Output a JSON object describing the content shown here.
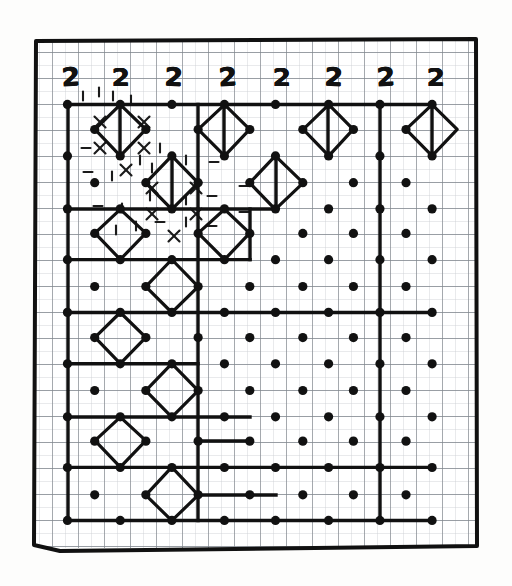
{
  "page": {
    "background_color": "#ffffff",
    "ink_color": "#111111",
    "graph_paper_color": "#8a8f96",
    "graph_paper_minor_color": "#c2c6cb"
  },
  "frame": {
    "border_color": "#111111",
    "border_width_px": 4,
    "x": 33,
    "y": 38,
    "width": 444,
    "height": 512
  },
  "clues": {
    "label": "top clue row",
    "values": [
      "2",
      "2",
      "2",
      "2",
      "2",
      "2",
      "2",
      "2"
    ],
    "positions_x": [
      70,
      120,
      173,
      227,
      281,
      333,
      385,
      435
    ],
    "position_y": 77
  },
  "grid": {
    "origin_x": 68,
    "origin_y": 104,
    "cell": 26,
    "minor_cell": 13,
    "cols": 15,
    "rows": 16,
    "dot_radius": 4.6,
    "lattice_note": "bold dots on alternating (checkerboard) lattice sites, spacing 52px diagonal"
  },
  "dots": [
    [
      68,
      104
    ],
    [
      120,
      104
    ],
    [
      172,
      104
    ],
    [
      224,
      104
    ],
    [
      276,
      104
    ],
    [
      328,
      104
    ],
    [
      380,
      104
    ],
    [
      432,
      104
    ],
    [
      94,
      130
    ],
    [
      146,
      130
    ],
    [
      198,
      130
    ],
    [
      250,
      130
    ],
    [
      302,
      130
    ],
    [
      354,
      130
    ],
    [
      406,
      130
    ],
    [
      68,
      156
    ],
    [
      120,
      156
    ],
    [
      172,
      156
    ],
    [
      224,
      156
    ],
    [
      276,
      156
    ],
    [
      328,
      156
    ],
    [
      380,
      156
    ],
    [
      432,
      156
    ],
    [
      94,
      182
    ],
    [
      146,
      182
    ],
    [
      198,
      182
    ],
    [
      250,
      182
    ],
    [
      302,
      182
    ],
    [
      354,
      182
    ],
    [
      406,
      182
    ],
    [
      68,
      208
    ],
    [
      120,
      208
    ],
    [
      172,
      208
    ],
    [
      224,
      208
    ],
    [
      276,
      208
    ],
    [
      328,
      208
    ],
    [
      380,
      208
    ],
    [
      432,
      208
    ],
    [
      94,
      234
    ],
    [
      146,
      234
    ],
    [
      198,
      234
    ],
    [
      250,
      234
    ],
    [
      302,
      234
    ],
    [
      354,
      234
    ],
    [
      406,
      234
    ],
    [
      68,
      260
    ],
    [
      120,
      260
    ],
    [
      172,
      260
    ],
    [
      224,
      260
    ],
    [
      276,
      260
    ],
    [
      328,
      260
    ],
    [
      380,
      260
    ],
    [
      432,
      260
    ],
    [
      94,
      286
    ],
    [
      146,
      286
    ],
    [
      198,
      286
    ],
    [
      250,
      286
    ],
    [
      302,
      286
    ],
    [
      354,
      286
    ],
    [
      406,
      286
    ],
    [
      68,
      312
    ],
    [
      120,
      312
    ],
    [
      172,
      312
    ],
    [
      224,
      312
    ],
    [
      276,
      312
    ],
    [
      328,
      312
    ],
    [
      380,
      312
    ],
    [
      432,
      312
    ],
    [
      94,
      338
    ],
    [
      146,
      338
    ],
    [
      198,
      338
    ],
    [
      250,
      338
    ],
    [
      302,
      338
    ],
    [
      354,
      338
    ],
    [
      406,
      338
    ],
    [
      68,
      364
    ],
    [
      120,
      364
    ],
    [
      172,
      364
    ],
    [
      224,
      364
    ],
    [
      276,
      364
    ],
    [
      328,
      364
    ],
    [
      380,
      364
    ],
    [
      432,
      364
    ],
    [
      94,
      390
    ],
    [
      146,
      390
    ],
    [
      198,
      390
    ],
    [
      250,
      390
    ],
    [
      302,
      390
    ],
    [
      354,
      390
    ],
    [
      406,
      390
    ],
    [
      68,
      416
    ],
    [
      120,
      416
    ],
    [
      172,
      416
    ],
    [
      224,
      416
    ],
    [
      276,
      416
    ],
    [
      328,
      416
    ],
    [
      380,
      416
    ],
    [
      432,
      416
    ],
    [
      94,
      442
    ],
    [
      146,
      442
    ],
    [
      198,
      442
    ],
    [
      250,
      442
    ],
    [
      302,
      442
    ],
    [
      354,
      442
    ],
    [
      406,
      442
    ],
    [
      68,
      468
    ],
    [
      120,
      468
    ],
    [
      172,
      468
    ],
    [
      224,
      468
    ],
    [
      276,
      468
    ],
    [
      328,
      468
    ],
    [
      380,
      468
    ],
    [
      432,
      468
    ],
    [
      94,
      494
    ],
    [
      146,
      494
    ],
    [
      198,
      494
    ],
    [
      250,
      494
    ],
    [
      302,
      494
    ],
    [
      354,
      494
    ],
    [
      406,
      494
    ],
    [
      68,
      520
    ],
    [
      120,
      520
    ],
    [
      172,
      520
    ],
    [
      224,
      520
    ],
    [
      276,
      520
    ],
    [
      328,
      520
    ],
    [
      380,
      520
    ],
    [
      432,
      520
    ]
  ],
  "diamonds": [
    {
      "cx": 120,
      "cy": 130,
      "r": 26,
      "name": "diamond-r1c1"
    },
    {
      "cx": 172,
      "cy": 182,
      "r": 26,
      "name": "diamond-r2c2"
    },
    {
      "cx": 224,
      "cy": 130,
      "r": 26,
      "name": "diamond-r1c3"
    },
    {
      "cx": 276,
      "cy": 182,
      "r": 26,
      "name": "diamond-r2c4"
    },
    {
      "cx": 328,
      "cy": 130,
      "r": 26,
      "name": "diamond-r1c5"
    },
    {
      "cx": 432,
      "cy": 130,
      "r": 26,
      "name": "diamond-r1c7"
    },
    {
      "cx": 120,
      "cy": 234,
      "r": 26,
      "name": "diamond-r3c1"
    },
    {
      "cx": 224,
      "cy": 234,
      "r": 26,
      "name": "diamond-r3c3"
    },
    {
      "cx": 172,
      "cy": 286,
      "r": 26,
      "name": "diamond-r4c2"
    },
    {
      "cx": 120,
      "cy": 338,
      "r": 26,
      "name": "diamond-r5c1"
    },
    {
      "cx": 172,
      "cy": 390,
      "r": 26,
      "name": "diamond-r6c2"
    },
    {
      "cx": 120,
      "cy": 442,
      "r": 26,
      "name": "diamond-r7c1"
    },
    {
      "cx": 172,
      "cy": 494,
      "r": 26,
      "name": "diamond-r8c2"
    }
  ],
  "bold_segments": [
    {
      "x1": 68,
      "y1": 104,
      "x2": 432,
      "y2": 104,
      "name": "top-bold-rail"
    },
    {
      "x1": 68,
      "y1": 104,
      "x2": 68,
      "y2": 520,
      "name": "left-bold-rail"
    },
    {
      "x1": 198,
      "y1": 104,
      "x2": 198,
      "y2": 520,
      "name": "mid-vertical-rail"
    },
    {
      "x1": 380,
      "y1": 104,
      "x2": 380,
      "y2": 520,
      "name": "right-vertical-rail"
    },
    {
      "x1": 68,
      "y1": 208,
      "x2": 198,
      "y2": 208,
      "name": "hrail-row3-left"
    },
    {
      "x1": 198,
      "y1": 208,
      "x2": 276,
      "y2": 208,
      "name": "hrail-row3-mid"
    },
    {
      "x1": 68,
      "y1": 260,
      "x2": 250,
      "y2": 260,
      "name": "hrail-row4"
    },
    {
      "x1": 250,
      "y1": 260,
      "x2": 250,
      "y2": 208,
      "name": "vstub-row4"
    },
    {
      "x1": 68,
      "y1": 312,
      "x2": 432,
      "y2": 312,
      "name": "hrail-row5-full"
    },
    {
      "x1": 68,
      "y1": 364,
      "x2": 198,
      "y2": 364,
      "name": "hrail-row6-left"
    },
    {
      "x1": 68,
      "y1": 416,
      "x2": 250,
      "y2": 416,
      "name": "hrail-row7"
    },
    {
      "x1": 68,
      "y1": 468,
      "x2": 432,
      "y2": 468,
      "name": "hrail-row8-full"
    },
    {
      "x1": 68,
      "y1": 520,
      "x2": 432,
      "y2": 520,
      "name": "bottom-rail"
    },
    {
      "x1": 432,
      "y1": 104,
      "x2": 432,
      "y2": 156,
      "name": "right-short-rail"
    },
    {
      "x1": 328,
      "y1": 104,
      "x2": 328,
      "y2": 156,
      "name": "col5-short-rail"
    },
    {
      "x1": 120,
      "y1": 104,
      "x2": 120,
      "y2": 156,
      "name": "col1-short-rail"
    },
    {
      "x1": 224,
      "y1": 104,
      "x2": 224,
      "y2": 156,
      "name": "col3-short-rail"
    },
    {
      "x1": 276,
      "y1": 156,
      "x2": 276,
      "y2": 208,
      "name": "col4-short-rail"
    },
    {
      "x1": 172,
      "y1": 156,
      "x2": 172,
      "y2": 208,
      "name": "col2-short-rail"
    },
    {
      "x1": 198,
      "y1": 494,
      "x2": 276,
      "y2": 494,
      "name": "bottom-stub"
    },
    {
      "x1": 198,
      "y1": 442,
      "x2": 250,
      "y2": 442,
      "name": "row7-stub"
    }
  ],
  "tick_marks": {
    "description": "small pencil dashes and X marks annotating the upper-left region",
    "dashes": [
      [
        83,
        96,
        "v"
      ],
      [
        99,
        92,
        "v"
      ],
      [
        113,
        96,
        "v"
      ],
      [
        131,
        100,
        "v"
      ],
      [
        86,
        148,
        "h"
      ],
      [
        160,
        148,
        "v"
      ],
      [
        88,
        172,
        "h"
      ],
      [
        112,
        176,
        "v"
      ],
      [
        140,
        160,
        "v"
      ],
      [
        152,
        168,
        "v"
      ],
      [
        186,
        160,
        "v"
      ],
      [
        214,
        162,
        "h"
      ],
      [
        150,
        196,
        "v"
      ],
      [
        186,
        200,
        "v"
      ],
      [
        212,
        196,
        "h"
      ],
      [
        122,
        208,
        "v"
      ],
      [
        244,
        186,
        "h"
      ],
      [
        244,
        212,
        "h"
      ],
      [
        136,
        226,
        "v"
      ],
      [
        160,
        222,
        "h"
      ],
      [
        186,
        222,
        "v"
      ],
      [
        212,
        226,
        "h"
      ],
      [
        116,
        230,
        "v"
      ],
      [
        98,
        206,
        "h"
      ]
    ],
    "crosses": [
      [
        100,
        122
      ],
      [
        144,
        122
      ],
      [
        100,
        148
      ],
      [
        144,
        148
      ],
      [
        126,
        170
      ],
      [
        152,
        188
      ],
      [
        196,
        188
      ],
      [
        152,
        214
      ],
      [
        196,
        214
      ],
      [
        174,
        236
      ]
    ]
  },
  "legend": {
    "dot": "lattice node",
    "diamond": "closed rotated-square loop",
    "bold_line": "solved path segment",
    "clue": "2 = two edges meet at this cell"
  }
}
